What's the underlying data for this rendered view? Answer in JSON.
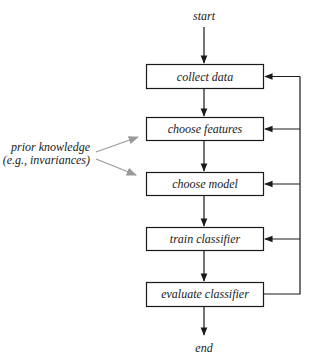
{
  "diagram": {
    "start_label": "start",
    "end_label": "end",
    "steps": [
      {
        "label": "collect data"
      },
      {
        "label": "choose features"
      },
      {
        "label": "choose model"
      },
      {
        "label": "train classifier"
      },
      {
        "label": "evaluate classifier"
      }
    ],
    "side_note": {
      "line1": "prior knowledge",
      "line2": "(e.g., invariances)",
      "targets": [
        "choose features",
        "choose model"
      ]
    },
    "feedback": {
      "from": "evaluate classifier",
      "to": [
        "collect data",
        "choose features",
        "choose model",
        "train classifier"
      ]
    },
    "colors": {
      "line": "#1a1a1a",
      "prior_knowledge_arrow": "#9a9a9a",
      "background": "#ffffff"
    }
  }
}
